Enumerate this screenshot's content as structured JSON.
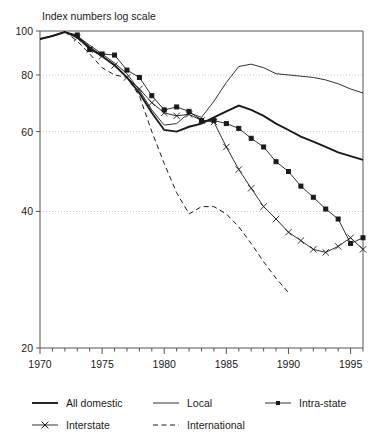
{
  "chart_data": {
    "type": "line",
    "title": "Index numbers log scale",
    "xlabel": "",
    "ylabel": "",
    "yscale": "log",
    "ylim": [
      20,
      100
    ],
    "xlim": [
      1970,
      1996
    ],
    "yticks": [
      20,
      40,
      60,
      80,
      100
    ],
    "xticks": [
      1970,
      1975,
      1980,
      1985,
      1990,
      1995
    ],
    "xtick_labels": [
      "1970",
      "1975",
      "1980",
      "1985",
      "1990",
      "1995"
    ],
    "ytick_labels": [
      "20",
      "40",
      "60",
      "80",
      "100"
    ],
    "grid": "horizontal-dotted",
    "legend_position": "below",
    "series": [
      {
        "name": "All domestic",
        "style": "thick-solid",
        "marker": "none",
        "color": "#1a1a1a",
        "x": [
          1970,
          1971,
          1972,
          1973,
          1974,
          1975,
          1976,
          1977,
          1978,
          1979,
          1980,
          1981,
          1982,
          1983,
          1984,
          1985,
          1986,
          1987,
          1988,
          1989,
          1990,
          1991,
          1992,
          1993,
          1994,
          1995,
          1996
        ],
        "values": [
          96,
          97.5,
          99.5,
          97,
          92,
          88,
          84,
          79,
          73,
          66,
          60.5,
          60,
          61.5,
          62.5,
          64.5,
          66.5,
          68.5,
          67,
          65,
          62.5,
          60.5,
          58.5,
          57,
          55.5,
          54,
          53,
          52
        ]
      },
      {
        "name": "Local",
        "style": "thin-solid",
        "marker": "none",
        "color": "#1a1a1a",
        "x": [
          1970,
          1971,
          1972,
          1973,
          1974,
          1975,
          1976,
          1977,
          1978,
          1979,
          1980,
          1981,
          1982,
          1983,
          1984,
          1985,
          1986,
          1987,
          1988,
          1989,
          1990,
          1991,
          1992,
          1993,
          1994,
          1995,
          1996
        ],
        "values": [
          96,
          97.5,
          99.5,
          97.5,
          93,
          89,
          85,
          80.5,
          74,
          67,
          62,
          62.5,
          66,
          64.5,
          70,
          77,
          83.5,
          84.5,
          83,
          80.5,
          80,
          79.5,
          79,
          78,
          76.5,
          74.5,
          73
        ]
      },
      {
        "name": "Intra-state",
        "style": "thin-solid",
        "marker": "square",
        "color": "#1a1a1a",
        "x": [
          1970,
          1971,
          1972,
          1973,
          1974,
          1975,
          1976,
          1977,
          1978,
          1979,
          1980,
          1981,
          1982,
          1983,
          1984,
          1985,
          1986,
          1987,
          1988,
          1989,
          1990,
          1991,
          1992,
          1993,
          1994,
          1995,
          1996
        ],
        "values": [
          96,
          97.5,
          99.5,
          98,
          91,
          89,
          88.5,
          82,
          79,
          72,
          67,
          68,
          66.5,
          63.5,
          63.5,
          62.5,
          61,
          58,
          55.5,
          51.5,
          49,
          45.5,
          43,
          40.5,
          38.5,
          34,
          35
        ]
      },
      {
        "name": "Interstate",
        "style": "thin-solid",
        "marker": "x",
        "color": "#1a1a1a",
        "x": [
          1970,
          1971,
          1972,
          1973,
          1974,
          1975,
          1976,
          1977,
          1978,
          1979,
          1980,
          1981,
          1982,
          1983,
          1984,
          1985,
          1986,
          1987,
          1988,
          1989,
          1990,
          1991,
          1992,
          1993,
          1994,
          1995,
          1996
        ],
        "values": [
          96,
          97.5,
          99.5,
          96.5,
          91,
          88,
          84,
          79,
          74.5,
          69.5,
          66,
          65,
          65.5,
          63.5,
          63,
          55.5,
          49.5,
          45,
          41,
          38.5,
          36,
          34.5,
          33,
          32.5,
          33.5,
          35,
          33
        ]
      },
      {
        "name": "International",
        "style": "dashed",
        "marker": "none",
        "color": "#1a1a1a",
        "x": [
          1970,
          1971,
          1972,
          1973,
          1974,
          1975,
          1976,
          1977,
          1978,
          1979,
          1980,
          1981,
          1982,
          1983,
          1984,
          1985,
          1986,
          1987,
          1988,
          1989,
          1990
        ],
        "values": [
          96,
          97.5,
          99.5,
          95,
          89,
          83,
          80,
          79,
          72,
          60,
          51,
          44,
          39.5,
          41,
          41,
          39.5,
          37,
          34,
          31,
          28.5,
          26.5
        ]
      }
    ]
  },
  "legend": {
    "items": [
      {
        "label": "All domestic",
        "style": "thick-solid",
        "marker": "none"
      },
      {
        "label": "Local",
        "style": "thin-solid",
        "marker": "none"
      },
      {
        "label": "Intra-state",
        "style": "thin-solid",
        "marker": "square"
      },
      {
        "label": "Interstate",
        "style": "thin-solid",
        "marker": "x"
      },
      {
        "label": "International",
        "style": "dashed",
        "marker": "none"
      }
    ]
  }
}
